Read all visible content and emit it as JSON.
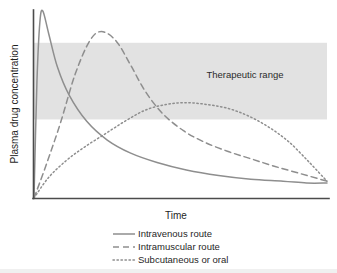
{
  "figure": {
    "background_color": "#ffffff",
    "curve_color": "#8e8e8e",
    "axis_color": "#4b4b4b",
    "band_color": "#e2e2e2"
  },
  "axes": {
    "y_title": "Plasma drug concentration",
    "x_title": "Time"
  },
  "band": {
    "label": "Therapeutic range"
  },
  "legend": {
    "items": [
      {
        "label": "Intravenous route",
        "style": "solid"
      },
      {
        "label": "Intramuscular route",
        "style": "dashed"
      },
      {
        "label": "Subcutaneous or oral",
        "style": "dotted"
      }
    ]
  },
  "chart_data": {
    "type": "line",
    "title": "",
    "xlabel": "Time",
    "ylabel": "Plasma drug concentration",
    "xlim": [
      0,
      100
    ],
    "ylim": [
      0,
      100
    ],
    "grid": false,
    "axis_ticks": {
      "x": [],
      "y": []
    },
    "legend_position": "below-plot",
    "annotations": [
      {
        "text": "Therapeutic range",
        "type": "band",
        "y_range": [
          42,
          83
        ],
        "x_range": [
          0,
          100
        ],
        "color": "#e2e2e2",
        "label_x": 72,
        "label_y": 64
      }
    ],
    "series": [
      {
        "name": "Intravenous route",
        "style": "solid",
        "peak_x": 3,
        "peak_y": 100,
        "x": [
          0,
          1,
          2,
          3,
          5,
          8,
          12,
          18,
          25,
          33,
          42,
          52,
          63,
          74,
          85,
          93,
          100
        ],
        "y": [
          0,
          62,
          94,
          100,
          88,
          70,
          55,
          41,
          31,
          24,
          19,
          15,
          12,
          10,
          9,
          8,
          8
        ]
      },
      {
        "name": "Intramuscular route",
        "style": "dashed",
        "peak_x": 23,
        "peak_y": 89,
        "x": [
          0,
          4,
          9,
          14,
          19,
          23,
          28,
          33,
          38,
          44,
          51,
          58,
          66,
          74,
          82,
          91,
          100
        ],
        "y": [
          0,
          17,
          40,
          66,
          84,
          89,
          84,
          71,
          57,
          45,
          36,
          30,
          25,
          21,
          17,
          13,
          9
        ]
      },
      {
        "name": "Subcutaneous or oral",
        "style": "dotted",
        "peak_x": 48,
        "peak_y": 51,
        "x": [
          0,
          5,
          11,
          17,
          24,
          31,
          38,
          45,
          52,
          59,
          66,
          73,
          80,
          87,
          94,
          100
        ],
        "y": [
          0,
          11,
          20,
          27,
          34,
          41,
          47,
          50,
          51,
          50,
          48,
          44,
          38,
          30,
          19,
          9
        ]
      }
    ]
  }
}
